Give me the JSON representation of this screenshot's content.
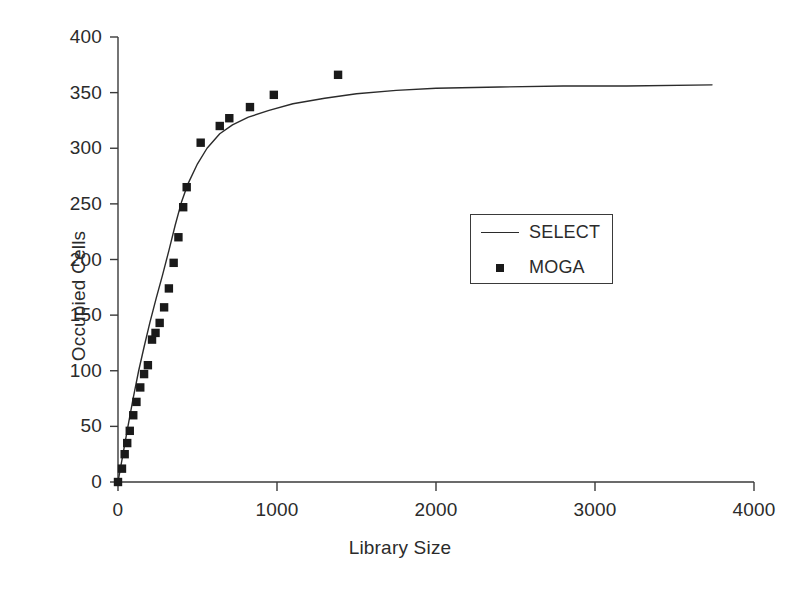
{
  "chart_data": {
    "type": "scatter",
    "title": "",
    "xlabel": "Library Size",
    "ylabel": "Occupied Cells",
    "xlim": [
      0,
      4000
    ],
    "ylim": [
      0,
      400
    ],
    "xticks": [
      0,
      1000,
      2000,
      3000,
      4000
    ],
    "yticks": [
      0,
      50,
      100,
      150,
      200,
      250,
      300,
      350,
      400
    ],
    "xtick_labels": [
      "0",
      "1000",
      "2000",
      "3000",
      "4000"
    ],
    "ytick_labels": [
      "0",
      "50",
      "100",
      "150",
      "200",
      "250",
      "300",
      "350",
      "400"
    ],
    "grid": false,
    "legend_position": "center-right",
    "series": [
      {
        "name": "SELECT",
        "style": "line",
        "marker": "none",
        "color": "#2b2b2b",
        "points": [
          [
            0,
            0
          ],
          [
            30,
            24
          ],
          [
            60,
            48
          ],
          [
            95,
            75
          ],
          [
            130,
            100
          ],
          [
            165,
            122
          ],
          [
            200,
            143
          ],
          [
            240,
            165
          ],
          [
            280,
            186
          ],
          [
            320,
            208
          ],
          [
            360,
            231
          ],
          [
            400,
            252
          ],
          [
            440,
            268
          ],
          [
            500,
            286
          ],
          [
            560,
            300
          ],
          [
            640,
            313
          ],
          [
            720,
            321
          ],
          [
            820,
            328
          ],
          [
            950,
            334
          ],
          [
            1100,
            340
          ],
          [
            1300,
            345
          ],
          [
            1500,
            349
          ],
          [
            1750,
            352
          ],
          [
            2000,
            354
          ],
          [
            2400,
            355
          ],
          [
            2800,
            356
          ],
          [
            3200,
            356
          ],
          [
            3736,
            357
          ]
        ]
      },
      {
        "name": "MOGA",
        "style": "markers",
        "marker": "square",
        "color": "#1a1a1a",
        "points": [
          [
            0,
            0
          ],
          [
            25,
            12
          ],
          [
            42,
            25
          ],
          [
            58,
            35
          ],
          [
            74,
            46
          ],
          [
            96,
            60
          ],
          [
            116,
            72
          ],
          [
            140,
            85
          ],
          [
            164,
            97
          ],
          [
            188,
            105
          ],
          [
            214,
            128
          ],
          [
            236,
            134
          ],
          [
            262,
            143
          ],
          [
            290,
            157
          ],
          [
            320,
            174
          ],
          [
            350,
            197
          ],
          [
            380,
            220
          ],
          [
            410,
            247
          ],
          [
            432,
            265
          ],
          [
            520,
            305
          ],
          [
            640,
            320
          ],
          [
            700,
            327
          ],
          [
            830,
            337
          ],
          [
            980,
            348
          ],
          [
            1384,
            366
          ]
        ]
      }
    ]
  },
  "legend": {
    "entries": [
      {
        "label": "SELECT",
        "key": "line-key-icon"
      },
      {
        "label": "MOGA",
        "key": "square-marker-icon"
      }
    ]
  },
  "axes": {
    "x_title": "Library Size",
    "y_title": "Occupied Cells"
  }
}
